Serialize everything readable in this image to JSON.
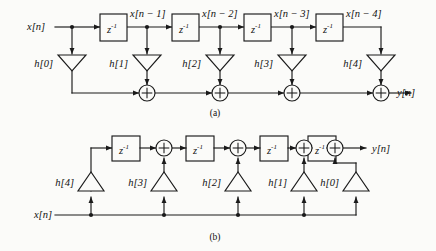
{
  "figure": {
    "title_caption_a": "(a)",
    "title_caption_b": "(b)",
    "line_color": "#1a1a1a",
    "background": "#fbfbf9"
  },
  "diagram_a": {
    "name": "direct-form-fir-structure",
    "input_label": "x[n]",
    "output_label": "y[n]",
    "delay_label_base": "z",
    "delay_label_exp": "-1",
    "signal_labels": [
      "x[n − 1]",
      "x[n − 2]",
      "x[n − 3]",
      "x[n − 4]"
    ],
    "coefficient_labels": [
      "h[0]",
      "h[1]",
      "h[2]",
      "h[3]",
      "h[4]"
    ],
    "adder_symbol": "+",
    "delay_count": 4,
    "adder_count": 4
  },
  "diagram_b": {
    "name": "transposed-direct-form-fir-structure",
    "input_label": "x[n]",
    "output_label": "y[n]",
    "delay_label_base": "z",
    "delay_label_exp": "-1",
    "coefficient_labels": [
      "h[4]",
      "h[3]",
      "h[2]",
      "h[1]",
      "h[0]"
    ],
    "adder_symbol": "+",
    "delay_count": 4,
    "adder_count": 4
  }
}
